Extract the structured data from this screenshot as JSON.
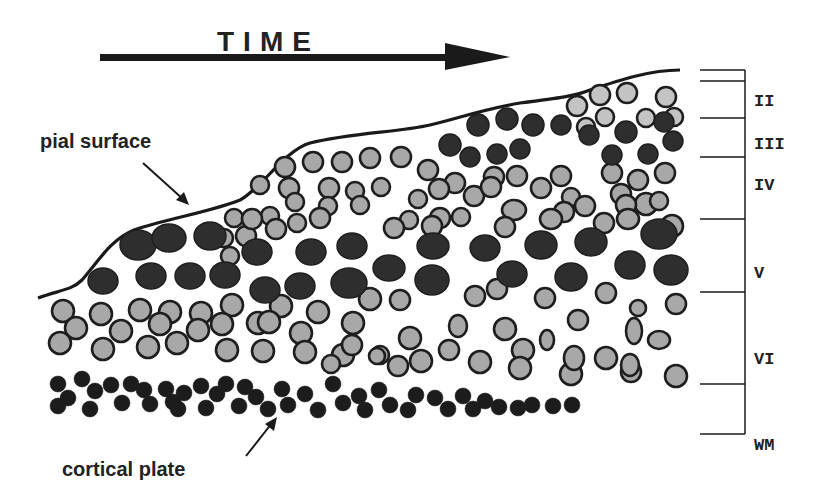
{
  "title": "TIME",
  "labels": {
    "pial_surface": "pial surface",
    "cortical_plate": "cortical plate"
  },
  "layers": [
    {
      "name": "II",
      "label_y": 106
    },
    {
      "name": "III",
      "label_y": 149
    },
    {
      "name": "IV",
      "label_y": 190
    },
    {
      "name": "V",
      "label_y": 278
    },
    {
      "name": "VI",
      "label_y": 364
    },
    {
      "name": "WM",
      "label_y": 450
    }
  ],
  "scale_ticks_y": [
    70,
    81,
    118,
    157,
    219,
    292,
    384,
    434
  ],
  "colors": {
    "dark_cell": "#2e2e2e",
    "light_cell": "#a8a8a8",
    "pale_cell": "#c4c4c4",
    "outline": "#1e1e1e",
    "line": "#1a1a1a"
  },
  "cells": {
    "large_dark": [
      [
        138,
        245,
        18,
        15
      ],
      [
        169,
        238,
        17,
        14
      ],
      [
        210,
        236,
        16,
        14
      ],
      [
        257,
        252,
        15,
        13
      ],
      [
        311,
        252,
        15,
        13
      ],
      [
        352,
        246,
        15,
        13
      ],
      [
        433,
        246,
        16,
        13
      ],
      [
        485,
        248,
        15,
        13
      ],
      [
        541,
        245,
        16,
        14
      ],
      [
        591,
        242,
        16,
        14
      ],
      [
        659,
        234,
        18,
        15
      ],
      [
        103,
        281,
        15,
        13
      ],
      [
        151,
        276,
        15,
        13
      ],
      [
        190,
        276,
        15,
        13
      ],
      [
        225,
        275,
        15,
        13
      ],
      [
        265,
        290,
        15,
        13
      ],
      [
        300,
        286,
        15,
        13
      ],
      [
        349,
        283,
        18,
        15
      ],
      [
        389,
        268,
        16,
        13
      ],
      [
        432,
        280,
        17,
        15
      ],
      [
        512,
        274,
        15,
        13
      ],
      [
        571,
        277,
        16,
        14
      ],
      [
        630,
        265,
        15,
        14
      ],
      [
        671,
        270,
        17,
        15
      ]
    ],
    "medium_dark": [
      [
        450,
        145,
        11,
        11
      ],
      [
        478,
        125,
        11,
        11
      ],
      [
        507,
        119,
        11,
        11
      ],
      [
        533,
        125,
        11,
        11
      ],
      [
        561,
        125,
        10,
        10
      ],
      [
        626,
        132,
        11,
        11
      ],
      [
        664,
        122,
        10,
        10
      ],
      [
        470,
        157,
        10,
        10
      ],
      [
        497,
        154,
        10,
        10
      ],
      [
        520,
        149,
        10,
        10
      ],
      [
        589,
        135,
        10,
        10
      ],
      [
        612,
        155,
        10,
        10
      ],
      [
        648,
        154,
        10,
        10
      ],
      [
        673,
        141,
        10,
        10
      ]
    ],
    "light_row_top": [
      [
        577,
        106,
        10,
        10
      ],
      [
        600,
        95,
        10,
        10
      ],
      [
        627,
        93,
        10,
        10
      ],
      [
        666,
        97,
        10,
        10
      ],
      [
        586,
        127,
        9,
        9
      ],
      [
        605,
        117,
        9,
        9
      ],
      [
        646,
        118,
        9,
        9
      ],
      [
        674,
        117,
        9,
        9
      ]
    ],
    "gray_upper": [
      [
        285,
        167,
        10,
        10
      ],
      [
        313,
        162,
        10,
        10
      ],
      [
        342,
        162,
        10,
        10
      ],
      [
        370,
        158,
        10,
        10
      ],
      [
        401,
        157,
        10,
        10
      ],
      [
        428,
        170,
        10,
        10
      ],
      [
        455,
        183,
        10,
        10
      ],
      [
        494,
        177,
        10,
        10
      ],
      [
        517,
        176,
        10,
        10
      ],
      [
        561,
        176,
        10,
        10
      ],
      [
        612,
        173,
        10,
        10
      ],
      [
        638,
        180,
        10,
        10
      ],
      [
        665,
        173,
        10,
        10
      ],
      [
        260,
        185,
        9,
        9
      ],
      [
        289,
        188,
        10,
        10
      ],
      [
        329,
        188,
        10,
        10
      ],
      [
        355,
        191,
        9,
        9
      ],
      [
        381,
        187,
        9,
        9
      ],
      [
        418,
        199,
        9,
        9
      ],
      [
        439,
        189,
        10,
        10
      ],
      [
        474,
        196,
        10,
        10
      ],
      [
        491,
        187,
        10,
        10
      ],
      [
        541,
        188,
        10,
        10
      ],
      [
        571,
        197,
        9,
        9
      ],
      [
        621,
        194,
        10,
        10
      ],
      [
        646,
        204,
        11,
        11
      ],
      [
        295,
        202,
        9,
        9
      ],
      [
        328,
        206,
        9,
        9
      ],
      [
        360,
        205,
        9,
        9
      ],
      [
        409,
        220,
        9,
        9
      ],
      [
        440,
        218,
        10,
        10
      ],
      [
        461,
        217,
        9,
        9
      ],
      [
        514,
        210,
        12,
        10
      ],
      [
        564,
        212,
        10,
        10
      ],
      [
        585,
        206,
        10,
        10
      ],
      [
        626,
        205,
        10,
        10
      ],
      [
        659,
        201,
        9,
        9
      ],
      [
        270,
        216,
        9,
        9
      ],
      [
        297,
        223,
        9,
        9
      ],
      [
        320,
        218,
        10,
        10
      ],
      [
        394,
        228,
        10,
        10
      ],
      [
        432,
        226,
        10,
        10
      ],
      [
        505,
        227,
        10,
        10
      ],
      [
        551,
        219,
        11,
        10
      ],
      [
        604,
        223,
        10,
        10
      ],
      [
        628,
        219,
        11,
        10
      ],
      [
        672,
        226,
        11,
        11
      ],
      [
        234,
        218,
        9,
        9
      ],
      [
        224,
        238,
        9,
        9
      ],
      [
        246,
        236,
        10,
        10
      ],
      [
        276,
        229,
        10,
        10
      ],
      [
        252,
        219,
        10,
        10
      ],
      [
        230,
        256,
        9,
        9
      ]
    ],
    "gray_lower": [
      [
        63,
        311,
        11,
        11
      ],
      [
        101,
        314,
        11,
        11
      ],
      [
        140,
        310,
        11,
        11
      ],
      [
        170,
        312,
        11,
        11
      ],
      [
        201,
        313,
        11,
        11
      ],
      [
        232,
        305,
        11,
        11
      ],
      [
        281,
        306,
        11,
        11
      ],
      [
        318,
        312,
        11,
        11
      ],
      [
        370,
        299,
        11,
        11
      ],
      [
        400,
        300,
        10,
        10
      ],
      [
        475,
        296,
        10,
        10
      ],
      [
        497,
        289,
        10,
        10
      ],
      [
        545,
        298,
        10,
        10
      ],
      [
        606,
        293,
        10,
        10
      ],
      [
        638,
        308,
        8,
        8
      ],
      [
        676,
        304,
        10,
        10
      ],
      [
        76,
        328,
        11,
        11
      ],
      [
        121,
        331,
        11,
        11
      ],
      [
        160,
        324,
        11,
        11
      ],
      [
        198,
        330,
        11,
        11
      ],
      [
        222,
        324,
        11,
        11
      ],
      [
        258,
        323,
        11,
        11
      ],
      [
        269,
        322,
        11,
        11
      ],
      [
        301,
        333,
        11,
        11
      ],
      [
        353,
        323,
        11,
        11
      ],
      [
        458,
        326,
        9,
        11
      ],
      [
        505,
        329,
        11,
        11
      ],
      [
        578,
        320,
        10,
        10
      ],
      [
        634,
        331,
        8,
        13
      ],
      [
        659,
        340,
        11,
        9
      ],
      [
        60,
        343,
        11,
        11
      ],
      [
        103,
        349,
        11,
        11
      ],
      [
        148,
        347,
        11,
        11
      ],
      [
        177,
        343,
        11,
        11
      ],
      [
        227,
        350,
        11,
        11
      ],
      [
        263,
        351,
        11,
        11
      ],
      [
        305,
        352,
        11,
        11
      ],
      [
        343,
        355,
        11,
        11
      ],
      [
        380,
        355,
        9,
        9
      ],
      [
        421,
        361,
        11,
        11
      ],
      [
        480,
        362,
        11,
        11
      ],
      [
        523,
        350,
        11,
        11
      ],
      [
        547,
        340,
        7,
        10
      ],
      [
        571,
        374,
        11,
        11
      ],
      [
        606,
        358,
        11,
        11
      ],
      [
        631,
        372,
        10,
        10
      ],
      [
        676,
        376,
        11,
        11
      ],
      [
        410,
        338,
        11,
        11
      ],
      [
        352,
        345,
        10,
        10
      ],
      [
        449,
        350,
        10,
        10
      ],
      [
        398,
        366,
        10,
        10
      ],
      [
        331,
        364,
        9,
        9
      ],
      [
        377,
        356,
        8,
        8
      ],
      [
        520,
        368,
        11,
        11
      ],
      [
        574,
        358,
        10,
        12
      ],
      [
        630,
        365,
        9,
        11
      ]
    ],
    "cortical_plate": [
      [
        58,
        384,
        8,
        8
      ],
      [
        82,
        379,
        8,
        8
      ],
      [
        68,
        398,
        8,
        8
      ],
      [
        95,
        391,
        8,
        8
      ],
      [
        111,
        385,
        8,
        8
      ],
      [
        58,
        406,
        8,
        8
      ],
      [
        90,
        409,
        8,
        8
      ],
      [
        122,
        403,
        8,
        8
      ],
      [
        131,
        384,
        8,
        8
      ],
      [
        144,
        390,
        8,
        8
      ],
      [
        150,
        404,
        8,
        8
      ],
      [
        166,
        389,
        8,
        8
      ],
      [
        173,
        402,
        8,
        8
      ],
      [
        184,
        393,
        8,
        8
      ],
      [
        178,
        409,
        8,
        8
      ],
      [
        201,
        386,
        8,
        8
      ],
      [
        206,
        408,
        8,
        8
      ],
      [
        217,
        394,
        8,
        8
      ],
      [
        226,
        384,
        8,
        8
      ],
      [
        239,
        406,
        8,
        8
      ],
      [
        245,
        387,
        8,
        8
      ],
      [
        256,
        397,
        8,
        8
      ],
      [
        268,
        409,
        8,
        8
      ],
      [
        282,
        389,
        8,
        8
      ],
      [
        288,
        405,
        8,
        8
      ],
      [
        305,
        394,
        8,
        8
      ],
      [
        318,
        410,
        8,
        8
      ],
      [
        333,
        384,
        8,
        8
      ],
      [
        343,
        403,
        8,
        8
      ],
      [
        359,
        396,
        8,
        8
      ],
      [
        365,
        410,
        8,
        8
      ],
      [
        379,
        390,
        8,
        8
      ],
      [
        390,
        405,
        8,
        8
      ],
      [
        408,
        410,
        8,
        8
      ],
      [
        416,
        395,
        8,
        8
      ],
      [
        435,
        398,
        8,
        8
      ],
      [
        448,
        409,
        8,
        8
      ],
      [
        463,
        396,
        8,
        8
      ],
      [
        473,
        409,
        8,
        8
      ],
      [
        485,
        401,
        8,
        8
      ],
      [
        499,
        407,
        8,
        8
      ],
      [
        518,
        408,
        8,
        8
      ],
      [
        532,
        405,
        8,
        8
      ],
      [
        553,
        406,
        8,
        8
      ],
      [
        572,
        405,
        8,
        8
      ]
    ]
  }
}
